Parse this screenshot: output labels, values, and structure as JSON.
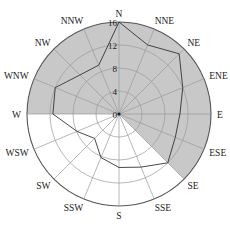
{
  "chart_data": {
    "type": "radar",
    "title": "",
    "directions": [
      "N",
      "NNE",
      "NE",
      "ENE",
      "E",
      "ESE",
      "SE",
      "SSE",
      "S",
      "SSW",
      "SW",
      "WSW",
      "W",
      "WNW",
      "NW",
      "NNW"
    ],
    "series": [
      {
        "name": "frequency",
        "values": [
          16,
          13,
          14.8,
          12,
          10.6,
          10.6,
          12,
          10,
          9.3,
          8.2,
          6,
          7.9,
          11.5,
          12,
          9.6,
          9.2
        ]
      }
    ],
    "radial_ticks": [
      0,
      4,
      8,
      12,
      16
    ],
    "rlim": [
      0,
      16
    ],
    "shaded_sector": {
      "from": "W",
      "to": "SE",
      "clockwise": true,
      "color": "#c8c8c8"
    },
    "grid": true
  },
  "colors": {
    "shade": "#c8c8c8",
    "grid": "#9a9a9a",
    "outer": "#555555",
    "line": "#333333"
  }
}
